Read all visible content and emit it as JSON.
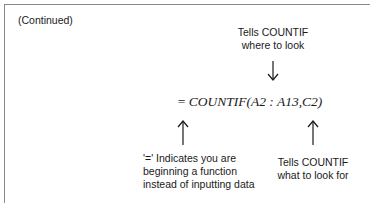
{
  "header": {
    "continued_label": "(Continued)"
  },
  "formula": {
    "equals": "=",
    "expression": "COUNTIF(A2 : A13,C2)"
  },
  "annotations": {
    "where": {
      "line1": "Tells COUNTIF",
      "line2": "where to look",
      "arrow": "down-arrow"
    },
    "equals_sign": {
      "line1": "'=' Indicates you are",
      "line2": "beginning a function",
      "line3": "instead of inputting data",
      "arrow": "up-arrow"
    },
    "what": {
      "line1": "Tells COUNTIF",
      "line2": "what to look for",
      "arrow": "up-arrow"
    }
  },
  "colors": {
    "border": "#8a8a8a",
    "text": "#1a1a1a",
    "background": "#ffffff"
  }
}
